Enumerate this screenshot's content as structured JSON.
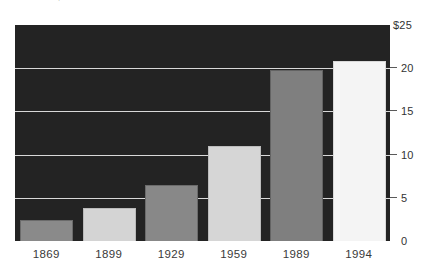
{
  "caption": {
    "text": "Measured in $ trillions"
  },
  "chart_data": {
    "type": "bar",
    "title": "",
    "subtitle": "",
    "xlabel": "",
    "ylabel": "",
    "categories": [
      "1869",
      "1899",
      "1929",
      "1959",
      "1989",
      "1994"
    ],
    "values": [
      2.4,
      3.8,
      6.5,
      11.0,
      19.8,
      20.8
    ],
    "series": [
      {
        "name": "",
        "values": [
          2.4,
          3.8,
          6.5,
          11.0,
          19.8,
          20.8
        ]
      }
    ],
    "ylim": [
      0,
      25
    ],
    "yticks": [
      0,
      5,
      10,
      15,
      20,
      25
    ],
    "ytick_labels": [
      "0",
      "5",
      "10",
      "15",
      "20",
      "$25"
    ],
    "grid": true,
    "grid_axis": "y",
    "legend": false,
    "legend_position": "none",
    "axis_position": "right",
    "plot_background": "#232323",
    "gridline_color": "#d8d8d8",
    "bar_colors": [
      "#8a8a8a",
      "#d4d4d4",
      "#888888",
      "#d6d6d6",
      "#7f7f7f",
      "#f4f4f4"
    ],
    "bar_edge_colors": [
      "#6b6b6b",
      "#b9b9b9",
      "#6b6b6b",
      "#bcbcbc",
      "#636363",
      "#d9d9d9"
    ]
  }
}
